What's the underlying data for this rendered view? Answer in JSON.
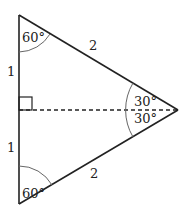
{
  "diagram": {
    "type": "equilateral-triangle-bisected",
    "side_labels": {
      "upper_half_left": "1",
      "lower_half_left": "1",
      "upper_slant": "2",
      "lower_slant": "2"
    },
    "angle_labels": {
      "top_vertex": "60°",
      "bottom_vertex": "60°",
      "right_upper": "30°",
      "right_lower": "30°"
    },
    "markers": {
      "right_angle": "right-angle-square",
      "altitude": "dashed-line"
    },
    "colors": {
      "stroke": "#222222",
      "arc": "#666666",
      "background": "#ffffff"
    }
  }
}
